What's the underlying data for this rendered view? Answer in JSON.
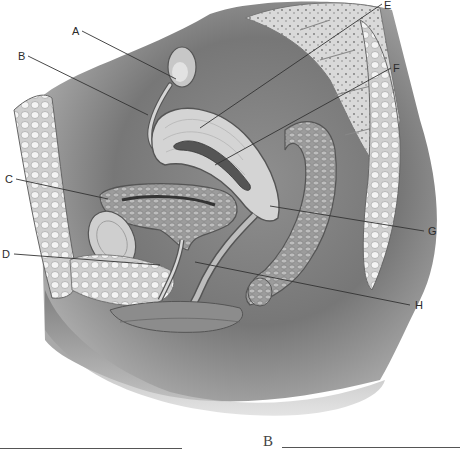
{
  "diagram": {
    "labels": [
      {
        "letter": "A",
        "x": 72,
        "y": 27,
        "target": "ovary"
      },
      {
        "letter": "B",
        "x": 18,
        "y": 52,
        "target": "uterine tube"
      },
      {
        "letter": "C",
        "x": 6,
        "y": 175,
        "target": "urinary bladder"
      },
      {
        "letter": "D",
        "x": 2,
        "y": 250,
        "target": "urethra"
      },
      {
        "letter": "E",
        "x": 384,
        "y": 0,
        "target": "uterus"
      },
      {
        "letter": "F",
        "x": 393,
        "y": 64,
        "target": "uterine cavity"
      },
      {
        "letter": "G",
        "x": 428,
        "y": 227,
        "target": "cervix / vagina"
      },
      {
        "letter": "H",
        "x": 415,
        "y": 301,
        "target": "vaginal orifice"
      }
    ]
  },
  "answer_blanks": [
    {
      "letter": "",
      "line_label": "blank-1"
    },
    {
      "letter": "B",
      "line_label": "blank-B"
    }
  ]
}
